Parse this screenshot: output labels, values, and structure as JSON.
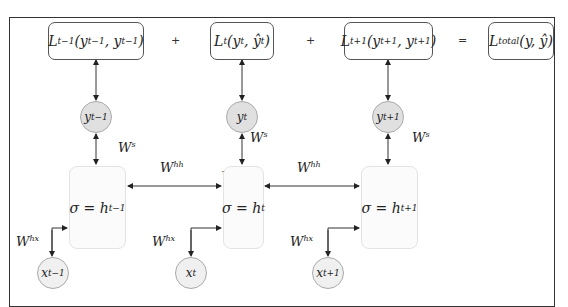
{
  "diagram": {
    "type": "unrolled-rnn",
    "loss_row": {
      "boxes": [
        {
          "id": "loss-t-minus-1",
          "label": "L_{t-1}(y_{t-1}, ŷ_{t-1})",
          "main": "L",
          "sub": "t−1",
          "args": "(y",
          "args_sub1": "t−1",
          "args_mid": ", y",
          "args_sub2": "t−1",
          "args_end": ")"
        },
        {
          "id": "loss-t",
          "label": "L_t(y_t, ŷ_t)",
          "main": "L",
          "sub": "t",
          "args": "(y",
          "args_sub1": "t",
          "args_mid": ", ŷ",
          "args_sub2": "t",
          "args_end": ")"
        },
        {
          "id": "loss-t-plus-1",
          "label": "L_{t+1}(y_{t+1}, ŷ_{t+1})",
          "main": "L",
          "sub": "t+1",
          "args": "(y",
          "args_sub1": "t+1",
          "args_mid": ", y",
          "args_sub2": "t+1",
          "args_end": ")"
        },
        {
          "id": "loss-total",
          "label": "L_total(y, ŷ)",
          "main": "L",
          "sub": "total",
          "args": "(y, ŷ)"
        }
      ],
      "operators": [
        "+",
        "+",
        "="
      ]
    },
    "outputs": [
      {
        "label": "y",
        "sub": "t−1"
      },
      {
        "label": "y",
        "sub": "t"
      },
      {
        "label": "y",
        "sub": "t+1"
      }
    ],
    "hidden_states": [
      {
        "label": "σ = h",
        "sub": "t−1"
      },
      {
        "label": "σ = h",
        "sub": "t"
      },
      {
        "label": "σ = h",
        "sub": "t+1"
      }
    ],
    "inputs": [
      {
        "label": "x",
        "sub": "t−1"
      },
      {
        "label": "x",
        "sub": "t"
      },
      {
        "label": "x",
        "sub": "t+1"
      }
    ],
    "weights": {
      "output": {
        "base": "W",
        "sup": "s"
      },
      "recurrent": {
        "base": "W",
        "sup": "hh"
      },
      "input": {
        "base": "W",
        "sup": "hx"
      }
    },
    "stray_text": "Text",
    "colors": {
      "circle_fill": "#e0e0e0",
      "hidden_fill": "#fbfbfb",
      "line": "#222222",
      "frame": "#333333"
    }
  }
}
